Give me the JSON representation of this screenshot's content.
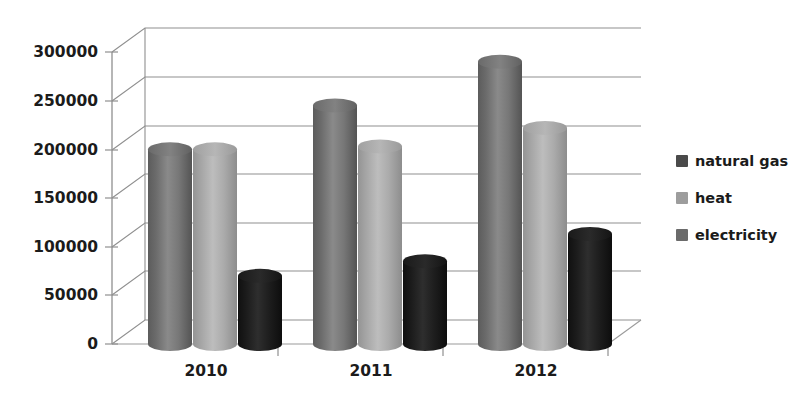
{
  "chart_data": {
    "type": "bar",
    "title": "",
    "subtitle": "",
    "xlabel": "",
    "ylabel": "",
    "categories": [
      "2010",
      "2011",
      "2012"
    ],
    "series": [
      {
        "name": "natural gas",
        "color": "#6f6f6f",
        "values": [
          200000,
          245000,
          290000
        ]
      },
      {
        "name": "heat",
        "color": "#a8a8a8",
        "values": [
          200000,
          203000,
          222000
        ]
      },
      {
        "name": "electricity",
        "color": "#1d1d1d",
        "values": [
          70000,
          85000,
          113000
        ]
      }
    ],
    "ytick_labels": [
      "0",
      "50000",
      "100000",
      "150000",
      "200000",
      "250000",
      "300000"
    ],
    "ytick_values": [
      0,
      50000,
      100000,
      150000,
      200000,
      250000,
      300000
    ],
    "ylim": [
      0,
      300000
    ],
    "grid": true,
    "grid_axis": "y",
    "legend_position": "right",
    "three_d": true,
    "bar_shape": "cylinder"
  },
  "legend": {
    "items": [
      {
        "label": "natural gas",
        "swatch_color": "#4a4a4a"
      },
      {
        "label": "heat",
        "swatch_color": "#9d9d9d"
      },
      {
        "label": "electricity",
        "swatch_color": "#6b6b6b"
      }
    ]
  },
  "axes": {
    "y_labels": [
      "300000",
      "250000",
      "200000",
      "150000",
      "100000",
      "50000",
      "0"
    ],
    "x_labels": [
      "2010",
      "2011",
      "2012"
    ]
  },
  "colors": {
    "background": "#ffffff",
    "gridline": "#8f8f8f",
    "axis": "#8f8f8f",
    "text": "#1b1b1b"
  }
}
